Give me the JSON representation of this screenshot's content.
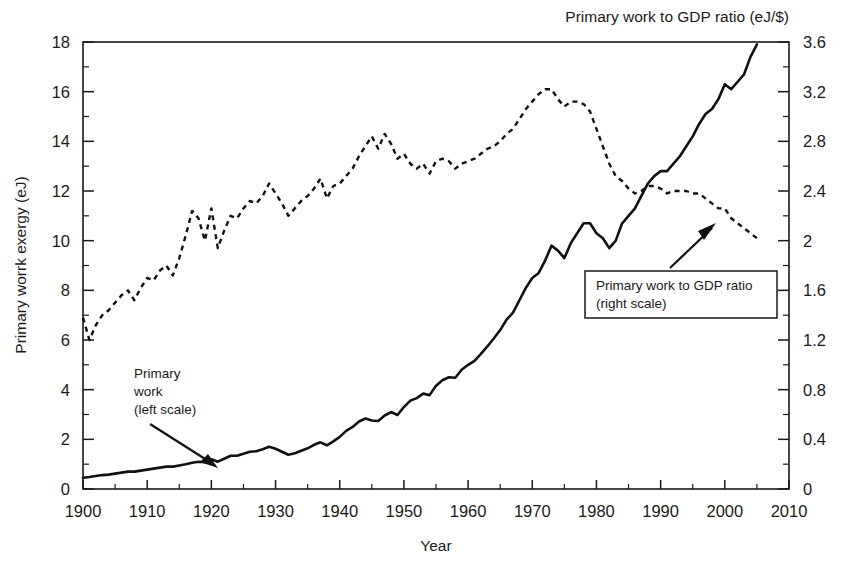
{
  "chart_data": {
    "type": "line",
    "title": "",
    "top_right_title": "Primary work to GDP ratio (eJ/$)",
    "xlabel": "Year",
    "ylabel": "Primary worrk exergy (eJ)",
    "xlim": [
      1900,
      2010
    ],
    "ylim": [
      0,
      18
    ],
    "y2lim": [
      0,
      3.6
    ],
    "grid": false,
    "legend_position": "inline-annotations",
    "xticks": [
      1900,
      1910,
      1920,
      1930,
      1940,
      1950,
      1960,
      1970,
      1980,
      1990,
      2000,
      2010
    ],
    "xtick_labels": [
      "1900",
      "1910",
      "1920",
      "1930",
      "1940",
      "1950",
      "1960",
      "1970",
      "1980",
      "1990",
      "2000",
      "2010"
    ],
    "xtick_minor_step": 5,
    "yticks": [
      0,
      2,
      4,
      6,
      8,
      10,
      12,
      14,
      16,
      18
    ],
    "ytick_labels": [
      "0",
      "2",
      "4",
      "6",
      "8",
      "10",
      "12",
      "14",
      "16",
      "18"
    ],
    "ytick_minor_step": 1,
    "y2ticks": [
      0,
      0.4,
      0.8,
      1.2,
      1.6,
      2,
      2.4,
      2.8,
      3.2,
      3.6
    ],
    "y2tick_labels": [
      "0",
      "0.4",
      "0.8",
      "1.2",
      "1.6",
      "2",
      "2.4",
      "2.8",
      "3.2",
      "3.6"
    ],
    "y2tick_minor_step": 0.2,
    "annotations": [
      {
        "id": "primary-work",
        "lines": [
          "Primary",
          "work",
          "(left scale)"
        ],
        "boxed": false,
        "points_to_year": 1922,
        "points_to_value": 1.35
      },
      {
        "id": "primary-work-to-gdp-ratio",
        "lines": [
          "Primary work to GDP ratio",
          "(right scale)"
        ],
        "boxed": true,
        "points_to_year": 1996,
        "points_to_value": 2.25
      }
    ],
    "series": [
      {
        "name": "Primary work",
        "axis": "left",
        "style": "solid",
        "units": "eJ",
        "x": [
          1900,
          1901,
          1902,
          1903,
          1904,
          1905,
          1906,
          1907,
          1908,
          1909,
          1910,
          1911,
          1912,
          1913,
          1914,
          1915,
          1916,
          1917,
          1918,
          1919,
          1920,
          1921,
          1922,
          1923,
          1924,
          1925,
          1926,
          1927,
          1928,
          1929,
          1930,
          1931,
          1932,
          1933,
          1934,
          1935,
          1936,
          1937,
          1938,
          1939,
          1940,
          1941,
          1942,
          1943,
          1944,
          1945,
          1946,
          1947,
          1948,
          1949,
          1950,
          1951,
          1952,
          1953,
          1954,
          1955,
          1956,
          1957,
          1958,
          1959,
          1960,
          1961,
          1962,
          1963,
          1964,
          1965,
          1966,
          1967,
          1968,
          1969,
          1970,
          1971,
          1972,
          1973,
          1974,
          1975,
          1976,
          1977,
          1978,
          1979,
          1980,
          1981,
          1982,
          1983,
          1984,
          1985,
          1986,
          1987,
          1988,
          1989,
          1990,
          1991,
          1992,
          1993,
          1994,
          1995,
          1996,
          1997,
          1998,
          1999,
          2000,
          2001,
          2002,
          2003,
          2004,
          2005
        ],
        "values": [
          0.45,
          0.48,
          0.52,
          0.56,
          0.58,
          0.62,
          0.66,
          0.7,
          0.7,
          0.74,
          0.78,
          0.82,
          0.86,
          0.9,
          0.9,
          0.95,
          1.0,
          1.06,
          1.1,
          1.08,
          1.2,
          1.1,
          1.22,
          1.34,
          1.34,
          1.42,
          1.5,
          1.52,
          1.6,
          1.7,
          1.62,
          1.5,
          1.38,
          1.44,
          1.54,
          1.64,
          1.78,
          1.88,
          1.76,
          1.92,
          2.1,
          2.34,
          2.5,
          2.72,
          2.84,
          2.76,
          2.74,
          2.96,
          3.1,
          2.98,
          3.3,
          3.56,
          3.66,
          3.84,
          3.78,
          4.16,
          4.38,
          4.5,
          4.48,
          4.8,
          5.0,
          5.16,
          5.44,
          5.74,
          6.06,
          6.4,
          6.82,
          7.1,
          7.6,
          8.1,
          8.5,
          8.7,
          9.2,
          9.8,
          9.6,
          9.3,
          9.9,
          10.3,
          10.7,
          10.7,
          10.3,
          10.1,
          9.7,
          10.0,
          10.7,
          11.0,
          11.3,
          11.8,
          12.3,
          12.6,
          12.8,
          12.8,
          13.1,
          13.4,
          13.8,
          14.2,
          14.7,
          15.1,
          15.3,
          15.7,
          16.3,
          16.1,
          16.4,
          16.7,
          17.4,
          17.9
        ]
      },
      {
        "name": "Primary work to GDP ratio",
        "axis": "right",
        "style": "dotted",
        "units": "eJ/$",
        "x": [
          1900,
          1901,
          1902,
          1903,
          1904,
          1905,
          1906,
          1907,
          1908,
          1909,
          1910,
          1911,
          1912,
          1913,
          1914,
          1915,
          1916,
          1917,
          1918,
          1919,
          1920,
          1921,
          1922,
          1923,
          1924,
          1925,
          1926,
          1927,
          1928,
          1929,
          1930,
          1931,
          1932,
          1933,
          1934,
          1935,
          1936,
          1937,
          1938,
          1939,
          1940,
          1941,
          1942,
          1943,
          1944,
          1945,
          1946,
          1947,
          1948,
          1949,
          1950,
          1951,
          1952,
          1953,
          1954,
          1955,
          1956,
          1957,
          1958,
          1959,
          1960,
          1961,
          1962,
          1963,
          1964,
          1965,
          1966,
          1967,
          1968,
          1969,
          1970,
          1971,
          1972,
          1973,
          1974,
          1975,
          1976,
          1977,
          1978,
          1979,
          1980,
          1981,
          1982,
          1983,
          1984,
          1985,
          1986,
          1987,
          1988,
          1989,
          1990,
          1991,
          1992,
          1993,
          1994,
          1995,
          1996,
          1997,
          1998,
          1999,
          2000,
          2001,
          2002,
          2003,
          2004,
          2005
        ],
        "values_right": [
          1.38,
          1.2,
          1.32,
          1.4,
          1.44,
          1.5,
          1.56,
          1.6,
          1.52,
          1.62,
          1.7,
          1.68,
          1.76,
          1.8,
          1.72,
          1.86,
          2.04,
          2.24,
          2.18,
          2.0,
          2.26,
          1.94,
          2.08,
          2.2,
          2.18,
          2.26,
          2.32,
          2.3,
          2.36,
          2.46,
          2.38,
          2.3,
          2.2,
          2.26,
          2.32,
          2.36,
          2.42,
          2.5,
          2.34,
          2.44,
          2.46,
          2.52,
          2.58,
          2.68,
          2.76,
          2.84,
          2.74,
          2.86,
          2.78,
          2.66,
          2.7,
          2.62,
          2.58,
          2.62,
          2.54,
          2.64,
          2.66,
          2.64,
          2.58,
          2.62,
          2.64,
          2.66,
          2.7,
          2.74,
          2.76,
          2.8,
          2.86,
          2.9,
          2.98,
          3.06,
          3.12,
          3.18,
          3.22,
          3.22,
          3.14,
          3.08,
          3.12,
          3.12,
          3.1,
          3.04,
          2.9,
          2.76,
          2.62,
          2.52,
          2.48,
          2.42,
          2.38,
          2.4,
          2.44,
          2.44,
          2.42,
          2.38,
          2.4,
          2.4,
          2.4,
          2.38,
          2.38,
          2.34,
          2.3,
          2.26,
          2.26,
          2.18,
          2.14,
          2.1,
          2.06,
          2.02
        ]
      }
    ]
  }
}
